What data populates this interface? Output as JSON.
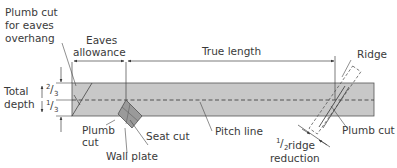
{
  "diagram": {
    "colors": {
      "rafter_fill": "#c8c8c8",
      "line": "#3a3a3a",
      "text": "#3a3a3a"
    },
    "labels": {
      "plumb_cut_eaves_1": "Plumb cut",
      "plumb_cut_eaves_2": "for eaves",
      "plumb_cut_eaves_3": "overhang",
      "eaves_allowance_1": "Eaves",
      "eaves_allowance_2": "allowance",
      "true_length": "True length",
      "ridge": "Ridge",
      "total_depth_1": "Total",
      "total_depth_2": "depth",
      "two_thirds_num": "2",
      "two_thirds_den": "3",
      "one_third_num": "1",
      "one_third_den": "3",
      "plumb_cut_left_1": "Plumb",
      "plumb_cut_left_2": "cut",
      "seat_cut": "Seat cut",
      "wall_plate": "Wall plate",
      "pitch_line": "Pitch line",
      "plumb_cut_right": "Plumb cut",
      "half_ridge_num": "1",
      "half_ridge_den": "2",
      "half_ridge_1": " ridge",
      "half_ridge_2": "reduction"
    }
  }
}
